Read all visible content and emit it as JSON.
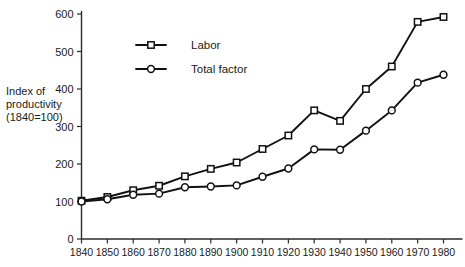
{
  "chart_data": {
    "type": "line",
    "title": "",
    "subtitle": "",
    "xlabel": "",
    "ylabel": "Index of productivity (1840=100)",
    "ylabel_lines": [
      "Index of",
      "productivity",
      "(1840=100)"
    ],
    "x": [
      1840,
      1850,
      1860,
      1870,
      1880,
      1890,
      1900,
      1910,
      1920,
      1930,
      1940,
      1950,
      1960,
      1970,
      1980
    ],
    "categories": [
      "1840",
      "1850",
      "1860",
      "1870",
      "1880",
      "1890",
      "1900",
      "1910",
      "1920",
      "1930",
      "1940",
      "1950",
      "1960",
      "1970",
      "1980"
    ],
    "xlim": [
      1840,
      1980
    ],
    "ylim": [
      0,
      600
    ],
    "yticks": [
      0,
      100,
      200,
      300,
      400,
      500,
      600
    ],
    "ytick_labels": [
      "0",
      "100",
      "200",
      "300",
      "400",
      "500",
      "600"
    ],
    "xticks": [
      1840,
      1850,
      1860,
      1870,
      1880,
      1890,
      1900,
      1910,
      1920,
      1930,
      1940,
      1950,
      1960,
      1970,
      1980
    ],
    "xtick_labels": [
      "1840",
      "1850",
      "1860",
      "1870",
      "1880",
      "1890",
      "1900",
      "1910",
      "1920",
      "1930",
      "1940",
      "1950",
      "1960",
      "1970",
      "1980"
    ],
    "grid": false,
    "legend_position": "upper-left-inside",
    "series": [
      {
        "name": "Labor",
        "marker": "square",
        "color": "#111111",
        "values": [
          102,
          112,
          130,
          142,
          167,
          187,
          204,
          240,
          276,
          343,
          315,
          400,
          460,
          579,
          592
        ]
      },
      {
        "name": "Total factor",
        "marker": "circle",
        "color": "#111111",
        "values": [
          100,
          106,
          118,
          121,
          138,
          140,
          143,
          166,
          188,
          239,
          238,
          289,
          343,
          417,
          438
        ]
      }
    ]
  },
  "legend": {
    "items": [
      {
        "label": "Labor",
        "marker": "square"
      },
      {
        "label": "Total factor",
        "marker": "circle"
      }
    ]
  }
}
